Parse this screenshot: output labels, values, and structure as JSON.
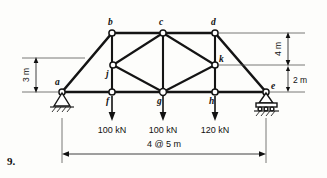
{
  "figure": {
    "problem_number": "9.",
    "type": "truss-diagram",
    "nodes": [
      {
        "label": "a",
        "x": 62,
        "y": 92,
        "lx": 55,
        "ly": 85
      },
      {
        "label": "b",
        "x": 112,
        "y": 33,
        "lx": 108,
        "ly": 25
      },
      {
        "label": "c",
        "x": 163,
        "y": 33,
        "lx": 159,
        "ly": 25
      },
      {
        "label": "d",
        "x": 215,
        "y": 33,
        "lx": 211,
        "ly": 25
      },
      {
        "label": "e",
        "x": 266,
        "y": 92,
        "lx": 270,
        "ly": 89
      },
      {
        "label": "f",
        "x": 112,
        "y": 92,
        "lx": 106,
        "ly": 103
      },
      {
        "label": "g",
        "x": 163,
        "y": 92,
        "lx": 157,
        "ly": 103
      },
      {
        "label": "h",
        "x": 215,
        "y": 92,
        "lx": 209,
        "ly": 103
      },
      {
        "label": "j",
        "x": 113,
        "y": 65,
        "lx": 107,
        "ly": 76
      },
      {
        "label": "k",
        "x": 215,
        "y": 65,
        "lx": 219,
        "ly": 62
      }
    ],
    "dimensions": [
      {
        "name": "left-height",
        "text": "3 m",
        "orientation": "vertical"
      },
      {
        "name": "right-height",
        "text": "4 m",
        "orientation": "vertical"
      },
      {
        "name": "right-offset",
        "text": "2 m",
        "orientation": "horizontal"
      },
      {
        "name": "span",
        "text": "4 @ 5 m",
        "orientation": "horizontal"
      }
    ],
    "loads": [
      {
        "node": "f",
        "text": "100 kN",
        "x": 112
      },
      {
        "node": "g",
        "text": "100 kN",
        "x": 163
      },
      {
        "node": "h",
        "text": "120 kN",
        "x": 215
      }
    ],
    "supports": [
      {
        "node": "a",
        "kind": "pin-support"
      },
      {
        "node": "e",
        "kind": "roller-support"
      }
    ],
    "colors": {
      "member": "#141414",
      "node_fill": "#ffffff",
      "dimension": "#2a2a2a",
      "background": "#fdfdfb"
    }
  }
}
